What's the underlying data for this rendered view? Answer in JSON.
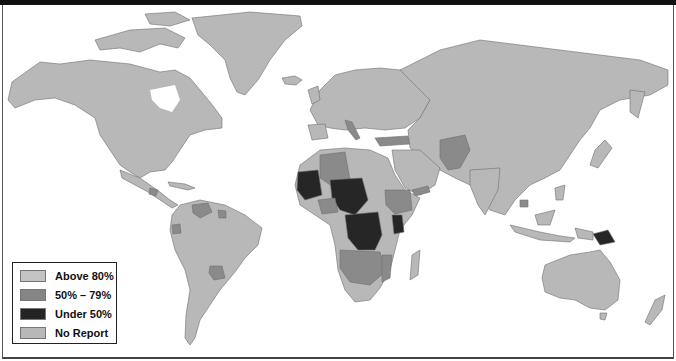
{
  "map": {
    "type": "world choropleth",
    "colors": {
      "above_80": "#bdbdbd",
      "range_50_79": "#8a8a8a",
      "under_50": "#262626",
      "no_report": "#b4b4b4",
      "ocean": "#ffffff",
      "border": "#6f6f6f"
    },
    "highlighted_regions": {
      "under_50": [
        "West Africa (Mauritania/Mali)",
        "Niger/Chad",
        "Central Africa (DR Congo, CAR, Congo)",
        "Kenya",
        "Papua New Guinea"
      ],
      "range_50_79": [
        "Algeria",
        "Angola",
        "Zambia",
        "Mozambique",
        "Ethiopia region",
        "Turkey",
        "Afghanistan/Pakistan",
        "Yemen",
        "Italy",
        "Cambodia",
        "Venezuela",
        "Guyana",
        "Ecuador",
        "Paraguay",
        "Guatemala"
      ]
    }
  },
  "legend": {
    "items": [
      {
        "label": "Above 80%",
        "color": "#c3c3c3"
      },
      {
        "label": "50% – 79%",
        "color": "#858585"
      },
      {
        "label": "Under 50%",
        "color": "#242424"
      },
      {
        "label": "No Report",
        "color": "#b8b8b8"
      }
    ]
  }
}
